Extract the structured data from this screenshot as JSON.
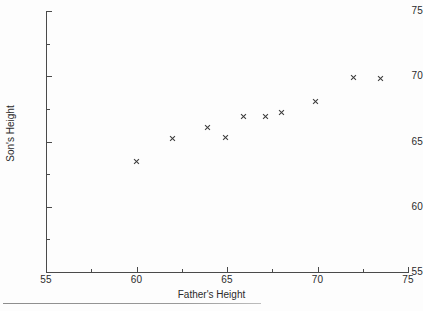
{
  "chart_data": {
    "type": "scatter",
    "title": "",
    "xlabel": "Father's Height",
    "ylabel": "Son's Height",
    "xlim": [
      55,
      75
    ],
    "ylim": [
      55,
      75
    ],
    "xticks": [
      55,
      60,
      65,
      70,
      75
    ],
    "yticks": [
      55,
      60,
      65,
      70,
      75
    ],
    "xtick_labels": [
      "55",
      "60",
      "65",
      "70",
      "75"
    ],
    "ytick_labels": [
      "55",
      "60",
      "65",
      "70",
      "75"
    ],
    "xminor_ticks": [
      57.5,
      62.5,
      67.5,
      72.5
    ],
    "yminor_ticks": [
      57.5,
      62.5,
      67.5,
      72.5
    ],
    "grid": false,
    "legend": null,
    "marker": "x",
    "marker_color": "#3a3a3a",
    "points": [
      {
        "x": 60.0,
        "y": 63.5
      },
      {
        "x": 62.0,
        "y": 65.2
      },
      {
        "x": 63.9,
        "y": 66.1
      },
      {
        "x": 64.9,
        "y": 65.3
      },
      {
        "x": 65.9,
        "y": 66.9
      },
      {
        "x": 67.1,
        "y": 66.9
      },
      {
        "x": 68.0,
        "y": 67.2
      },
      {
        "x": 69.9,
        "y": 68.1
      },
      {
        "x": 72.0,
        "y": 69.9
      },
      {
        "x": 73.5,
        "y": 69.8
      }
    ]
  },
  "axes": {
    "x_tick_label_0": "55",
    "x_tick_label_1": "60",
    "x_tick_label_2": "65",
    "x_tick_label_3": "70",
    "x_tick_label_4": "75",
    "y_tick_label_0": "55",
    "y_tick_label_1": "60",
    "y_tick_label_2": "65",
    "y_tick_label_3": "70",
    "y_tick_label_4": "75"
  },
  "colors": {
    "axis": "#4a4a4a",
    "marker": "#3a3a3a",
    "text": "#2b2b2b",
    "background": "#fdfdfd",
    "rule": "#8d8d8d"
  }
}
